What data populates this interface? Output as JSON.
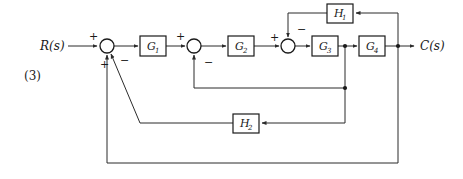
{
  "figure": {
    "index_label": "(3)",
    "type": "control-system-block-diagram",
    "line_color": "#2b2b2b",
    "box_border_color": "#1a1a1a",
    "background_color": "#ffffff"
  },
  "signals": {
    "input_label": "R(s)",
    "output_label": "C(s)"
  },
  "blocks": [
    {
      "id": "G1",
      "label": "G",
      "subscript": "1",
      "x": 140,
      "y": 36,
      "w": 26,
      "h": 20
    },
    {
      "id": "G2",
      "label": "G",
      "subscript": "2",
      "x": 228,
      "y": 36,
      "w": 26,
      "h": 20
    },
    {
      "id": "G3",
      "label": "G",
      "subscript": "3",
      "x": 312,
      "y": 36,
      "w": 26,
      "h": 20
    },
    {
      "id": "G4",
      "label": "G",
      "subscript": "4",
      "x": 359,
      "y": 36,
      "w": 26,
      "h": 20
    },
    {
      "id": "H1",
      "label": "H",
      "subscript": "1",
      "x": 327,
      "y": 4,
      "w": 26,
      "h": 19
    },
    {
      "id": "H2",
      "label": "H",
      "subscript": "2",
      "x": 233,
      "y": 114,
      "w": 26,
      "h": 19
    }
  ],
  "summing_junctions": [
    {
      "id": "sum1",
      "cx": 107,
      "cy": 46,
      "r": 7,
      "signs": [
        {
          "text": "+",
          "x": 89,
          "y": 36,
          "port": "input-left"
        },
        {
          "text": "+",
          "x": 100,
          "y": 64,
          "port": "feedback-bottom"
        },
        {
          "text": "−",
          "x": 122,
          "y": 60,
          "port": "feedback-diagonal"
        }
      ]
    },
    {
      "id": "sum2",
      "cx": 194,
      "cy": 46,
      "r": 7,
      "signs": [
        {
          "text": "+",
          "x": 176,
          "y": 36,
          "port": "input-left"
        },
        {
          "text": "−",
          "x": 206,
          "y": 62,
          "port": "feedback-bottom"
        }
      ]
    },
    {
      "id": "sum3",
      "cx": 288,
      "cy": 46,
      "r": 7,
      "signs": [
        {
          "text": "+",
          "x": 270,
          "y": 37,
          "port": "input-left"
        },
        {
          "text": "−",
          "x": 299,
          "y": 28,
          "port": "feedback-top"
        }
      ]
    }
  ],
  "takeoff_nodes": [
    {
      "id": "node-g3-out",
      "x": 345,
      "y": 46
    },
    {
      "id": "node-g4-out",
      "x": 398,
      "y": 46
    },
    {
      "id": "node-inner-mid",
      "x": 345,
      "y": 88
    }
  ],
  "connections": [
    {
      "id": "wire-input-to-sum1",
      "from": "R(s)",
      "to": "sum1"
    },
    {
      "id": "wire-sum1-to-g1",
      "from": "sum1",
      "to": "G1"
    },
    {
      "id": "wire-g1-to-sum2",
      "from": "G1",
      "to": "sum2"
    },
    {
      "id": "wire-sum2-to-g2",
      "from": "sum2",
      "to": "G2"
    },
    {
      "id": "wire-g2-to-sum3",
      "from": "G2",
      "to": "sum3"
    },
    {
      "id": "wire-sum3-to-g3",
      "from": "sum3",
      "to": "G3"
    },
    {
      "id": "wire-g3-to-g4",
      "from": "G3",
      "to": "G4"
    },
    {
      "id": "wire-g4-to-output",
      "from": "G4",
      "to": "C(s)"
    },
    {
      "id": "wire-h1-feedback",
      "from": "node-g4-out",
      "to": "sum3",
      "via": "H1",
      "sign": "−"
    },
    {
      "id": "wire-inner-feedback",
      "from": "node-g3-out",
      "to": "sum2",
      "sign": "−"
    },
    {
      "id": "wire-h2-feedback",
      "from": "node-g3-out",
      "to": "sum1",
      "via": "H2",
      "sign": "−"
    },
    {
      "id": "wire-outer-feedback",
      "from": "node-g4-out",
      "to": "sum1",
      "sign": "+"
    }
  ]
}
